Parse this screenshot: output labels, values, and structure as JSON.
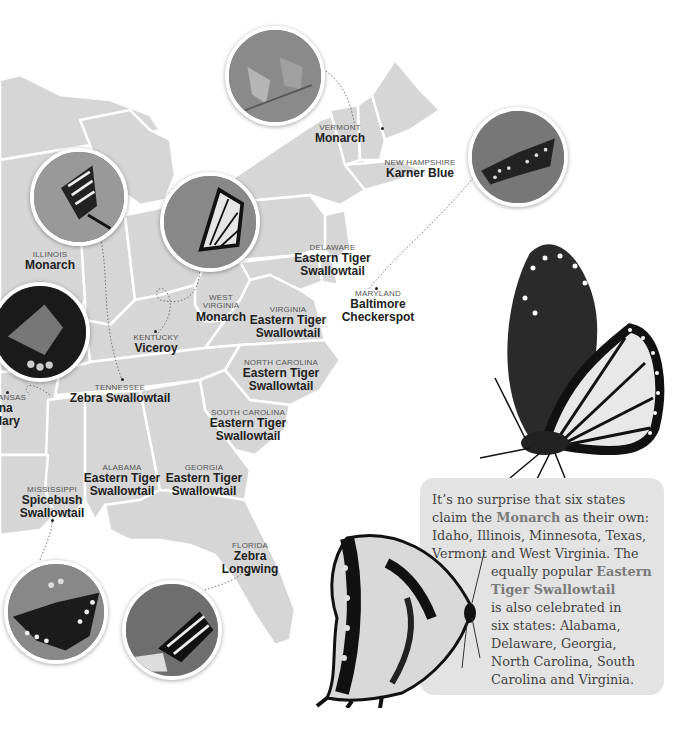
{
  "map": {
    "fill_color": "#d6d6d6",
    "border_color": "#ffffff",
    "background": "#ffffff"
  },
  "states": [
    {
      "id": "vermont",
      "state": "VERMONT",
      "butterfly": "Monarch"
    },
    {
      "id": "new-hampshire",
      "state": "NEW HAMPSHIRE",
      "butterfly": "Karner Blue"
    },
    {
      "id": "delaware",
      "state": "DELAWARE",
      "butterfly_line1": "Eastern Tiger",
      "butterfly_line2": "Swallowtail"
    },
    {
      "id": "maryland",
      "state": "MARYLAND",
      "butterfly_line1": "Baltimore",
      "butterfly_line2": "Checkerspot"
    },
    {
      "id": "illinois",
      "state": "ILLINOIS",
      "butterfly": "Monarch"
    },
    {
      "id": "west-virginia",
      "state_line1": "WEST",
      "state_line2": "VIRGINIA",
      "butterfly": "Monarch"
    },
    {
      "id": "virginia",
      "state": "VIRGINIA",
      "butterfly_line1": "Eastern Tiger",
      "butterfly_line2": "Swallowtail"
    },
    {
      "id": "kentucky",
      "state": "KENTUCKY",
      "butterfly": "Viceroy"
    },
    {
      "id": "north-carolina",
      "state": "NORTH CAROLINA",
      "butterfly_line1": "Eastern Tiger",
      "butterfly_line2": "Swallowtail"
    },
    {
      "id": "tennessee",
      "state": "TENNESSEE",
      "butterfly": "Zebra Swallowtail"
    },
    {
      "id": "arkansas",
      "state": "ANSAS",
      "butterfly_line1": "ana",
      "butterfly_line2": "illary"
    },
    {
      "id": "south-carolina",
      "state": "SOUTH CAROLINA",
      "butterfly_line1": "Eastern Tiger",
      "butterfly_line2": "Swallowtail"
    },
    {
      "id": "alabama",
      "state": "ALABAMA",
      "butterfly_line1": "Eastern Tiger",
      "butterfly_line2": "Swallowtail"
    },
    {
      "id": "georgia",
      "state": "GEORGIA",
      "butterfly_line1": "Eastern Tiger",
      "butterfly_line2": "Swallowtail"
    },
    {
      "id": "mississippi",
      "state": "MISSISSIPPI",
      "butterfly_line1": "Spicebush",
      "butterfly_line2": "Swallowtail"
    },
    {
      "id": "florida",
      "state": "FLORIDA",
      "butterfly_line1": "Zebra",
      "butterfly_line2": "Longwing"
    }
  ],
  "photos": [
    {
      "id": "karner-blue-photo",
      "subject": "Karner Blue"
    },
    {
      "id": "baltimore-checkerspot-photo",
      "subject": "Baltimore Checkerspot"
    },
    {
      "id": "zebra-swallowtail-photo",
      "subject": "Zebra Swallowtail"
    },
    {
      "id": "viceroy-photo",
      "subject": "Viceroy"
    },
    {
      "id": "diana-fritillary-photo",
      "subject": "Diana Fritillary"
    },
    {
      "id": "spicebush-swallowtail-photo",
      "subject": "Spicebush Swallowtail"
    },
    {
      "id": "zebra-longwing-photo",
      "subject": "Zebra Longwing"
    }
  ],
  "callout": {
    "line1": "It’s no surprise that six states",
    "line2_pre": "claim the ",
    "line2_hl": "Monarch",
    "line2_post": " as their own:",
    "line3": "Idaho, Illinois, Minnesota, Texas,",
    "line4": "Vermont and West Virginia. The",
    "line5_pre": "equally popular ",
    "line5_hl": "Eastern",
    "line6_hl": "Tiger Swallowtail",
    "line7": "is also celebrated in",
    "line8": "six states: Alabama,",
    "line9": "Delaware, Georgia,",
    "line10": "North Carolina, South",
    "line11": "Carolina and Virginia.",
    "background": "#e3e3e3",
    "highlight_color": "#7a7a7a"
  }
}
